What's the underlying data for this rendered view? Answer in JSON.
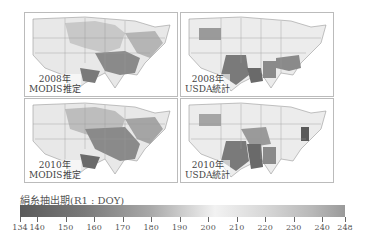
{
  "panels": [
    {
      "id": "modis-2008",
      "year": "2008年",
      "source": "MODIS推定",
      "type": "modis"
    },
    {
      "id": "usda-2008",
      "year": "2008年",
      "source": "USDA統計",
      "type": "usda"
    },
    {
      "id": "modis-2010",
      "year": "2010年",
      "source": "MODIS推定",
      "type": "modis"
    },
    {
      "id": "usda-2010",
      "year": "2010年",
      "source": "USDA統計",
      "type": "usda"
    }
  ],
  "colorbar": {
    "title": "絹糸抽出期(R1 : DOY)",
    "min": 134,
    "max": 248,
    "ticks": [
      "134",
      "140",
      "150",
      "160",
      "170",
      "180",
      "190",
      "200",
      "210",
      "220",
      "230",
      "240",
      "248"
    ],
    "colors": {
      "low": "#5a5a5a",
      "mid": "#f2f2f2",
      "high": "#9a9a9a"
    }
  }
}
